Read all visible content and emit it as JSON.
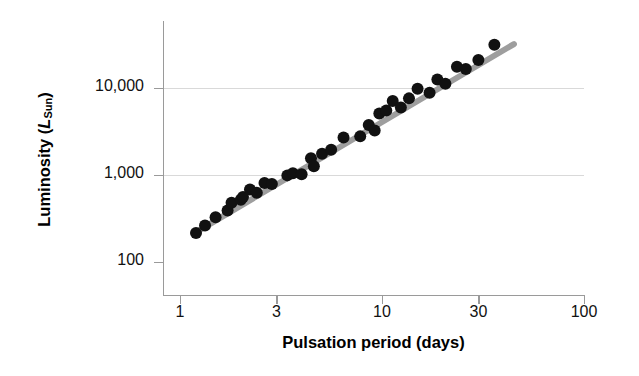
{
  "chart_data": {
    "type": "scatter",
    "title": "",
    "xlabel": "Pulsation period (days)",
    "ylabel_prefix": "Luminosity (",
    "ylabel_symbol": "L",
    "ylabel_subscript": "Sun",
    "ylabel_suffix": ")",
    "ylabel_plain": "Luminosity (L_Sun)",
    "xscale": "log",
    "yscale": "log",
    "xlim": [
      1,
      100
    ],
    "ylim": [
      60,
      60000
    ],
    "xticks": [
      1,
      3,
      10,
      30,
      100
    ],
    "xticklabels": [
      "1",
      "3",
      "10",
      "30",
      "100"
    ],
    "yticks": [
      100,
      1000,
      10000
    ],
    "yticklabels": [
      "100",
      "1,000",
      "10,000"
    ],
    "grid": "horizontal-major-only",
    "legend": "none",
    "marker_color": "#111111",
    "marker_size_px": 12,
    "trendline_color": "#9e9e9e",
    "trendline_width_px": 6,
    "trendline_endpoints": [
      [
        1.18,
        215
      ],
      [
        45.0,
        32000
      ]
    ],
    "series": [
      {
        "name": "Cepheid variables",
        "points": [
          [
            1.2,
            216
          ],
          [
            1.33,
            262
          ],
          [
            1.5,
            326
          ],
          [
            1.72,
            390
          ],
          [
            1.8,
            480
          ],
          [
            2.0,
            520
          ],
          [
            2.05,
            560
          ],
          [
            2.22,
            680
          ],
          [
            2.4,
            625
          ],
          [
            2.62,
            810
          ],
          [
            2.85,
            790
          ],
          [
            3.4,
            990
          ],
          [
            3.62,
            1050
          ],
          [
            4.0,
            1020
          ],
          [
            4.45,
            1560
          ],
          [
            4.6,
            1260
          ],
          [
            5.05,
            1760
          ],
          [
            5.6,
            1950
          ],
          [
            6.45,
            2700
          ],
          [
            7.8,
            2780
          ],
          [
            8.6,
            3750
          ],
          [
            9.2,
            3250
          ],
          [
            9.7,
            5100
          ],
          [
            10.5,
            5500
          ],
          [
            11.3,
            7100
          ],
          [
            12.4,
            5950
          ],
          [
            13.6,
            7600
          ],
          [
            15.0,
            9800
          ],
          [
            17.2,
            8800
          ],
          [
            18.8,
            12500
          ],
          [
            20.6,
            11200
          ],
          [
            23.5,
            17500
          ],
          [
            26.0,
            16500
          ],
          [
            30.0,
            21000
          ],
          [
            36.0,
            31500
          ]
        ]
      }
    ]
  }
}
